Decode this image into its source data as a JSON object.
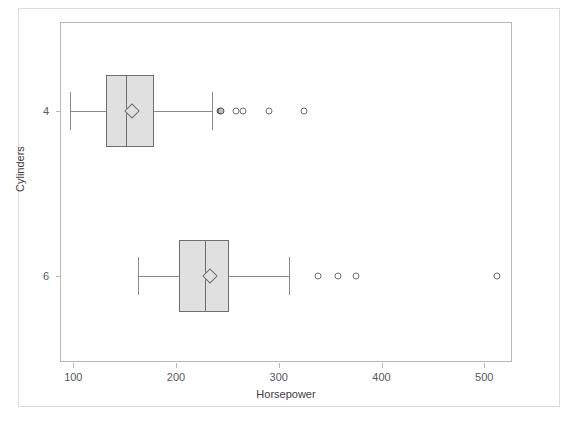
{
  "chart_data": {
    "type": "boxplot",
    "title": "",
    "xlabel": "Horsepower",
    "ylabel": "Cylinders",
    "xlim": [
      88,
      528
    ],
    "xticks": [
      100,
      200,
      300,
      400,
      500
    ],
    "xticklabels": [
      "100",
      "200",
      "300",
      "400",
      "500"
    ],
    "yticks": [
      "4",
      "6"
    ],
    "grid": false,
    "legend": false,
    "orientation": "horizontal",
    "groups": [
      {
        "category": "4",
        "y_pixel_fraction": 0.26,
        "whisker_low": 97,
        "q1": 132,
        "median": 151,
        "mean": 157,
        "q3": 179,
        "whisker_high": 235,
        "outliers": [
          243,
          244,
          258,
          265,
          290,
          325
        ]
      },
      {
        "category": "6",
        "y_pixel_fraction": 0.745,
        "whisker_low": 163,
        "q1": 203,
        "median": 228,
        "mean": 233,
        "q3": 252,
        "whisker_high": 310,
        "outliers": [
          338,
          358,
          375,
          512
        ]
      }
    ]
  },
  "axis": {
    "x_title": "Horsepower",
    "y_title": "Cylinders",
    "x_tick_labels": [
      "100",
      "200",
      "300",
      "400",
      "500"
    ],
    "y_tick_labels": [
      "4",
      "6"
    ]
  },
  "colors": {
    "box_fill": "#e0e0e0",
    "box_stroke": "#6f6f6f",
    "whisker": "#8a8a8a",
    "frame": "#b9b9b9",
    "outer_border": "#dcdcdc",
    "text": "#3c3c3e",
    "background": "#ffffff"
  }
}
